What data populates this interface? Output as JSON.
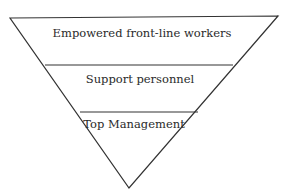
{
  "diagram": {
    "type": "inverted-pyramid",
    "line_color": "#333333",
    "background": "#ffffff",
    "layers": [
      {
        "label": "Empowered front-line workers"
      },
      {
        "label": "Support personnel"
      },
      {
        "label": "Top Management"
      }
    ]
  }
}
